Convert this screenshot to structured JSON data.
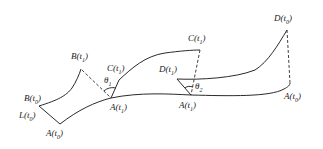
{
  "diagram": {
    "type": "geometric curve schematic",
    "stroke_color": "#2a2a2a",
    "background": "#ffffff",
    "labels": {
      "B_t0": {
        "base": "B(t",
        "sub": "0",
        "close": ")"
      },
      "L_t0": {
        "base": "L(t",
        "sub": "0",
        "close": ")"
      },
      "A_t0_left": {
        "base": "A(t",
        "sub": "0",
        "close": ")"
      },
      "B_t1": {
        "base": "B(t",
        "sub": "1",
        "close": ")"
      },
      "C_t1_left": {
        "base": "C(t",
        "sub": "1",
        "close": ")"
      },
      "theta1": {
        "base": "θ",
        "sub": "1",
        "close": ""
      },
      "A_t1_left": {
        "base": "A(t",
        "sub": "1",
        "close": ")"
      },
      "C_t1_right": {
        "base": "C(t",
        "sub": "1",
        "close": ")"
      },
      "D_t1": {
        "base": "D(t",
        "sub": "1",
        "close": ")"
      },
      "theta2": {
        "base": "θ",
        "sub": "2",
        "close": ""
      },
      "A_t1_right": {
        "base": "A(t",
        "sub": "1",
        "close": ")"
      },
      "D_t0": {
        "base": "D(t",
        "sub": "0",
        "close": ")"
      },
      "A_t0_right": {
        "base": "A(t",
        "sub": "0",
        "close": ")"
      }
    }
  }
}
